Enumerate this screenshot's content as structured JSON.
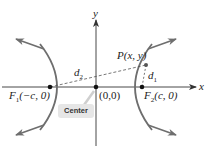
{
  "diagram": {
    "type": "hyperbola",
    "axes": {
      "x_label": "x",
      "y_label": "y"
    },
    "origin_label": "(0,0)",
    "foci": [
      {
        "name": "F1",
        "label_base": "F",
        "label_sub": "1",
        "label_coords": "(−c, 0)"
      },
      {
        "name": "F2",
        "label_base": "F",
        "label_sub": "2",
        "label_coords": "(c, 0)"
      }
    ],
    "point": {
      "label": "P(x, y)"
    },
    "distances": [
      {
        "base": "d",
        "sub": "1"
      },
      {
        "base": "d",
        "sub": "2"
      }
    ],
    "callout": {
      "label": "Center"
    },
    "colors": {
      "curve": "#6e6e6e",
      "axis": "#333333",
      "callout_bg": "#e6e6e6",
      "dashed": "#555555"
    }
  }
}
